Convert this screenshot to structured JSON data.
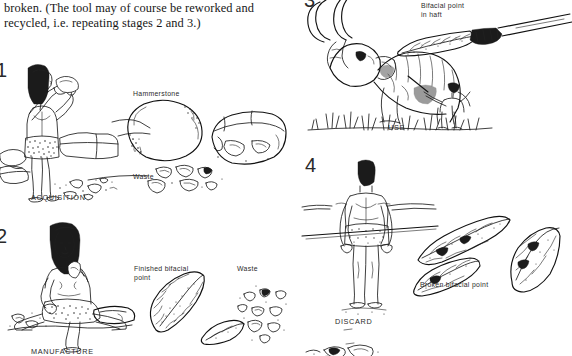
{
  "figure": {
    "caption_text": "broken. (The tool may of course be reworked and recycled, i.e. repeating stages 2 and 3.)",
    "background_color": "#ffffff",
    "ink_color": "#1d1d1d"
  },
  "stages": [
    {
      "number": "1",
      "caption": "ACQUISITION",
      "labels": [
        {
          "name": "hammerstone",
          "text": "Hammerstone"
        },
        {
          "name": "waste",
          "text": "Waste"
        }
      ],
      "scene_description": "standing figure striking a core with a hammerstone among boulders"
    },
    {
      "number": "2",
      "caption": "MANUFACTURE",
      "labels": [
        {
          "name": "finished-bifacial-point",
          "text": "Finished bifacial\npoint"
        },
        {
          "name": "waste",
          "text": "Waste"
        }
      ],
      "scene_description": "seated figure knapping a biface, debitage scattered around"
    },
    {
      "number": "3",
      "caption": "USE",
      "labels": [
        {
          "name": "bifacial-point-in-haft",
          "text": "Bifacial point\nin haft"
        }
      ],
      "scene_description": "hunter spearing a mammoth standing in grass"
    },
    {
      "number": "4",
      "caption": "DISCARD",
      "labels": [
        {
          "name": "broken-bifacial-point",
          "text": "Broken bifacial point"
        }
      ],
      "scene_description": "figure walking away from discarded broken point fragments"
    }
  ]
}
